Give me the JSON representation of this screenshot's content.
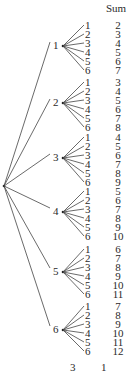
{
  "header": {
    "sum_label": "Sum"
  },
  "tree": {
    "root": {
      "x": 4,
      "y": 186
    },
    "branches": [
      {
        "label": "1",
        "node_y": 46,
        "leaf_start_y": 25,
        "sums": [
          "2",
          "3",
          "4",
          "5",
          "6",
          "7"
        ]
      },
      {
        "label": "2",
        "node_y": 103,
        "leaf_start_y": 82,
        "sums": [
          "3",
          "4",
          "5",
          "6",
          "7",
          "8"
        ]
      },
      {
        "label": "3",
        "node_y": 158,
        "leaf_start_y": 137,
        "sums": [
          "4",
          "5",
          "6",
          "7",
          "8",
          "9"
        ]
      },
      {
        "label": "4",
        "node_y": 212,
        "leaf_start_y": 191,
        "sums": [
          "5",
          "6",
          "7",
          "8",
          "9",
          "10"
        ]
      },
      {
        "label": "5",
        "node_y": 272,
        "leaf_start_y": 249,
        "sums": [
          "6",
          "7",
          "8",
          "9",
          "10",
          "11"
        ]
      },
      {
        "label": "6",
        "node_y": 330,
        "leaf_start_y": 306,
        "sums": [
          "7",
          "8",
          "9",
          "10",
          "11",
          "12"
        ]
      }
    ],
    "leaf_labels": [
      "1",
      "2",
      "3",
      "4",
      "5",
      "6"
    ]
  },
  "footer": {
    "col_a": "3",
    "col_b": "1"
  }
}
